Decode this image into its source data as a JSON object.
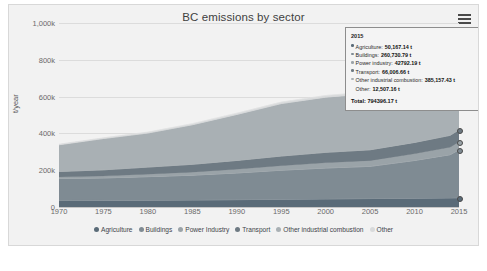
{
  "chart": {
    "title": "BC emissions by sector",
    "menu_icon": "hamburger-menu-icon"
  },
  "chart_data": {
    "type": "area",
    "title": "BC emissions by sector",
    "subtitle": "",
    "xlabel": "",
    "ylabel": "t/year",
    "stacked": true,
    "grid": true,
    "legend_position": "bottom",
    "xlim": [
      1970,
      2015
    ],
    "ylim": [
      0,
      1000000
    ],
    "xticks": [
      "1970",
      "1975",
      "1980",
      "1985",
      "1990",
      "1995",
      "2000",
      "2005",
      "2010",
      "2015"
    ],
    "yticks": [
      "0",
      "200k",
      "400k",
      "600k",
      "800k",
      "1,000k"
    ],
    "x": [
      1970,
      1975,
      1980,
      1985,
      1990,
      1995,
      2000,
      2005,
      2010,
      2014,
      2015
    ],
    "series": [
      {
        "name": "Agriculture",
        "color": "#5a6b78",
        "values": [
          35000,
          36000,
          37000,
          38000,
          40000,
          42000,
          44000,
          46000,
          48000,
          49500,
          50167
        ]
      },
      {
        "name": "Buildings",
        "color": "#7f8b93",
        "values": [
          120000,
          122000,
          128000,
          135000,
          145000,
          158000,
          168000,
          175000,
          205000,
          235000,
          260731
        ]
      },
      {
        "name": "Power Industry",
        "color": "#9aa3a8",
        "values": [
          8000,
          10000,
          13000,
          16000,
          20000,
          24000,
          28000,
          31000,
          36000,
          40000,
          42792
        ]
      },
      {
        "name": "Transport",
        "color": "#6e7a83",
        "values": [
          30000,
          34000,
          39000,
          43000,
          48000,
          53000,
          57000,
          59000,
          62000,
          65000,
          66007
        ]
      },
      {
        "name": "Other industrial combustion",
        "color": "#a9b0b4",
        "values": [
          145000,
          170000,
          185000,
          215000,
          250000,
          285000,
          300000,
          305000,
          330000,
          360000,
          385157
        ]
      },
      {
        "name": "Other",
        "color": "#d8dadb",
        "values": [
          3000,
          4000,
          5000,
          6000,
          7000,
          8000,
          9000,
          10000,
          11000,
          12000,
          12507
        ]
      }
    ],
    "totals": [
      341000,
      376000,
      407000,
      453000,
      510000,
      570000,
      606000,
      626000,
      692000,
      761500,
      794396
    ]
  },
  "legend": {
    "items": [
      {
        "label": "Agriculture",
        "color": "#5a6b78"
      },
      {
        "label": "Buildings",
        "color": "#7f8b93"
      },
      {
        "label": "Power Industry",
        "color": "#9aa3a8"
      },
      {
        "label": "Transport",
        "color": "#6e7a83"
      },
      {
        "label": "Other industrial combustion",
        "color": "#a9b0b4"
      },
      {
        "label": "Other",
        "color": "#d8dadb"
      }
    ]
  },
  "tooltip": {
    "header": "2015",
    "rows": [
      {
        "name": "Agriculture:",
        "value": "50,167.14 t",
        "color": "#5a6b78",
        "dot": true
      },
      {
        "name": "Buildings:",
        "value": "260,730.79 t",
        "color": "#7f8b93",
        "dot": true
      },
      {
        "name": "Power industry:",
        "value": "42792.19 t",
        "color": "#9aa3a8",
        "dot": true
      },
      {
        "name": "Transport:",
        "value": "66,006.66 t",
        "color": "#6e7a83",
        "dot": true
      },
      {
        "name": "Other industrial combustion:",
        "value": "385,157.43 t",
        "color": "#a9b0b4",
        "dot": true
      },
      {
        "name": "Other:",
        "value": "12,507.16 t",
        "color": "#d8dadb",
        "dot": false
      }
    ],
    "total_label": "Total:",
    "total_value": "794396.17 t"
  }
}
